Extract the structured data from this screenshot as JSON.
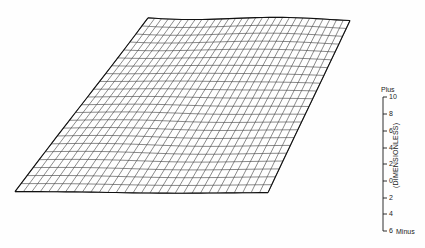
{
  "figure": {
    "background_color": "#fefefe",
    "line_color": "#2b2b2b",
    "edge_color": "#111111",
    "type": "3d-wireframe-surface"
  },
  "surface": {
    "name": "mesh-surface",
    "description": "Nearly flat undulating wireframe surface drawn in oblique projection",
    "corners": {
      "top_left": [
        148,
        17
      ],
      "top_right": [
        350,
        20
      ],
      "bottom_right": [
        268,
        193
      ],
      "bottom_left": [
        15,
        192
      ]
    },
    "grid_columns": 30,
    "grid_rows": 22
  },
  "scale": {
    "name": "dimensionless-scale-bar",
    "axis_title": "(DIMENSIONLESS)",
    "top_label": "Plus",
    "bottom_label": "Minus",
    "axis_x": 383,
    "axis_top_y": 97,
    "axis_bottom_y": 231,
    "ticks": [
      {
        "label": "10",
        "value": 10,
        "y": 97
      },
      {
        "label": "8",
        "value": 8,
        "y": 114
      },
      {
        "label": "6",
        "value": 6,
        "y": 131
      },
      {
        "label": "4",
        "value": 4,
        "y": 148
      },
      {
        "label": "2",
        "value": 2,
        "y": 164
      },
      {
        "label": "0",
        "value": 0,
        "y": 181
      },
      {
        "label": "2",
        "value": -2,
        "y": 198
      },
      {
        "label": "4",
        "value": -4,
        "y": 214
      },
      {
        "label": "6",
        "value": -6,
        "y": 231
      }
    ]
  },
  "chart_data": {
    "type": "surface",
    "title": "",
    "xlabel": "",
    "ylabel": "",
    "zlabel": "(DIMENSIONLESS)",
    "zlim": [
      -6,
      10
    ],
    "ztick_labels": [
      "10",
      "8",
      "6",
      "4",
      "2",
      "0",
      "2",
      "4",
      "6"
    ],
    "ztick_values": [
      10,
      8,
      6,
      4,
      2,
      0,
      -2,
      -4,
      -6
    ],
    "z_positive_label": "Plus",
    "z_negative_label": "Minus",
    "grid": true,
    "legend": "none",
    "nx": 30,
    "ny": 22,
    "surface_note": "Near-zero amplitude rippled plane; deviations under about one scale unit across the whole field"
  }
}
